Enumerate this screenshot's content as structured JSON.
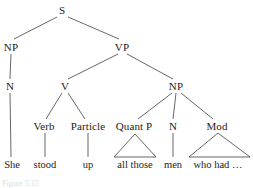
{
  "figure": {
    "kind": "syntax-tree",
    "sentence": "She stood up all those men who had …",
    "stroke_color": "#555555",
    "text_color": "#1c1c1c",
    "background": "#ffffff",
    "caption_fragment": "Figure 5.15"
  },
  "nodes": {
    "s": {
      "label": "S",
      "x": 62,
      "y": 10
    },
    "np_subj": {
      "label": "NP",
      "x": 11,
      "y": 47
    },
    "vp": {
      "label": "VP",
      "x": 122,
      "y": 47
    },
    "n_subj": {
      "label": "N",
      "x": 10,
      "y": 86
    },
    "v": {
      "label": "V",
      "x": 65,
      "y": 86
    },
    "np_obj": {
      "label": "NP",
      "x": 176,
      "y": 86
    },
    "verb": {
      "label": "Verb",
      "x": 44,
      "y": 126
    },
    "particle": {
      "label": "Particle",
      "x": 88,
      "y": 126
    },
    "quantp": {
      "label": "Quant P",
      "x": 134,
      "y": 126
    },
    "n_obj": {
      "label": "N",
      "x": 173,
      "y": 126
    },
    "mod": {
      "label": "Mod",
      "x": 217,
      "y": 126
    }
  },
  "terminals": {
    "she": {
      "label": "She",
      "x": 12,
      "y": 164
    },
    "stood": {
      "label": "stood",
      "x": 45,
      "y": 164
    },
    "up": {
      "label": "up",
      "x": 88,
      "y": 164
    },
    "allthose": {
      "label": "all those",
      "x": 135,
      "y": 164
    },
    "men": {
      "label": "men",
      "x": 173,
      "y": 164
    },
    "whohad": {
      "label": "who had …",
      "x": 218,
      "y": 164
    }
  },
  "edges": [
    {
      "name": "s-to-np-subj",
      "x1": 57,
      "y1": 17,
      "x2": 14,
      "y2": 39
    },
    {
      "name": "s-to-vp",
      "x1": 68,
      "y1": 17,
      "x2": 119,
      "y2": 39
    },
    {
      "name": "np-subj-to-n",
      "x1": 11,
      "y1": 54,
      "x2": 10,
      "y2": 79
    },
    {
      "name": "vp-to-v",
      "x1": 118,
      "y1": 54,
      "x2": 68,
      "y2": 79
    },
    {
      "name": "vp-to-np-obj",
      "x1": 127,
      "y1": 54,
      "x2": 173,
      "y2": 79
    },
    {
      "name": "n-subj-to-she",
      "x1": 10,
      "y1": 93,
      "x2": 11,
      "y2": 157
    },
    {
      "name": "v-to-verb",
      "x1": 62,
      "y1": 93,
      "x2": 46,
      "y2": 119
    },
    {
      "name": "v-to-particle",
      "x1": 68,
      "y1": 93,
      "x2": 85,
      "y2": 119
    },
    {
      "name": "np-obj-to-quantp",
      "x1": 172,
      "y1": 93,
      "x2": 138,
      "y2": 119
    },
    {
      "name": "np-obj-to-n-obj",
      "x1": 176,
      "y1": 93,
      "x2": 173,
      "y2": 119
    },
    {
      "name": "np-obj-to-mod",
      "x1": 181,
      "y1": 93,
      "x2": 213,
      "y2": 119
    },
    {
      "name": "verb-to-stood",
      "x1": 45,
      "y1": 133,
      "x2": 45,
      "y2": 157
    },
    {
      "name": "particle-to-up",
      "x1": 88,
      "y1": 133,
      "x2": 88,
      "y2": 157
    },
    {
      "name": "n-obj-to-men",
      "x1": 173,
      "y1": 133,
      "x2": 173,
      "y2": 157
    }
  ],
  "triangles": [
    {
      "name": "quantp-triangle",
      "apex_x": 135,
      "apex_y": 134,
      "left_x": 114,
      "right_x": 156,
      "base_y": 157
    },
    {
      "name": "mod-triangle",
      "apex_x": 218,
      "apex_y": 133,
      "left_x": 189,
      "right_x": 250,
      "base_y": 157
    }
  ]
}
